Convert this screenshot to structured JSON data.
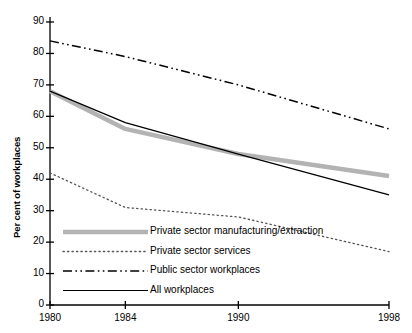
{
  "chart_data": {
    "type": "line",
    "title": "",
    "subtitle": "",
    "xlabel": "",
    "ylabel": "Per cent of workplaces",
    "x": [
      1980,
      1984,
      1990,
      1998
    ],
    "xtick_labels": [
      "1980",
      "1984",
      "1990",
      "1998"
    ],
    "xlim": [
      1980,
      1998
    ],
    "ylim": [
      0,
      90
    ],
    "ytick_values": [
      0,
      10,
      20,
      30,
      40,
      50,
      60,
      70,
      80,
      90
    ],
    "ytick_labels": [
      "0",
      "10",
      "20",
      "30",
      "40",
      "50",
      "60",
      "70",
      "80",
      "90"
    ],
    "grid": false,
    "legend_position": "inside-bottom-left",
    "series": [
      {
        "name": "Private sector manufacturing/extraction",
        "values": [
          68,
          56,
          48,
          41
        ],
        "style": "thick-solid",
        "color": "#b3b3b3",
        "width": 4.5
      },
      {
        "name": "Private sector services",
        "values": [
          42,
          31,
          28,
          17
        ],
        "style": "dotted",
        "color": "#555555",
        "width": 1.3
      },
      {
        "name": "Public sector workplaces",
        "values": [
          84,
          79,
          70,
          56
        ],
        "style": "dash-dot-dot",
        "color": "#000000",
        "width": 1.5
      },
      {
        "name": "All workplaces",
        "values": [
          68,
          58,
          48,
          35
        ],
        "style": "thin-solid",
        "color": "#000000",
        "width": 1.2
      }
    ]
  },
  "legend": {
    "items": [
      {
        "label": "Private sector manufacturing/extraction"
      },
      {
        "label": "Private sector services"
      },
      {
        "label": "Public sector workplaces"
      },
      {
        "label": "All workplaces"
      }
    ]
  },
  "colors": {
    "axis": "#000000",
    "background": "#ffffff",
    "gray_series": "#b3b3b3",
    "dotted_series": "#555555",
    "black_series": "#000000"
  }
}
